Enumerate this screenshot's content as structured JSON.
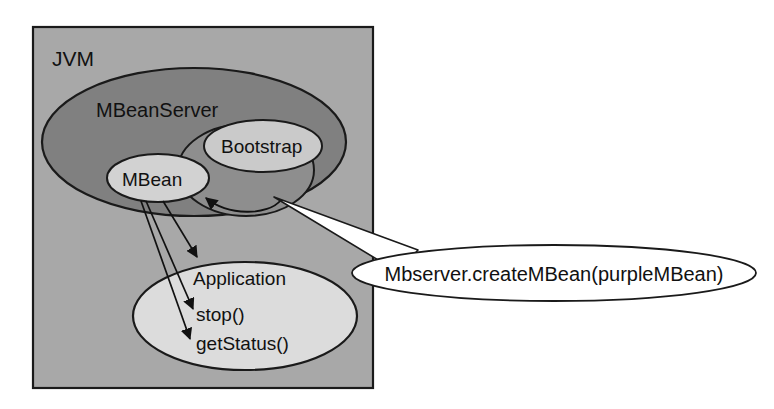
{
  "diagram": {
    "nodes": {
      "jvm": {
        "label": "JVM",
        "shape": "rectangle",
        "fill": "#a8a8a8"
      },
      "mbeanserver": {
        "label": "MBeanServer",
        "shape": "ellipse",
        "fill": "#808080"
      },
      "bootstrap": {
        "label": "Bootstrap",
        "shape": "ellipse",
        "fill": "#cacaca"
      },
      "agent": {
        "label": "",
        "shape": "ellipse",
        "fill": "#8e8e8e"
      },
      "mbean": {
        "label": "MBean",
        "shape": "ellipse",
        "fill": "#d2d2d2"
      },
      "application": {
        "label": "Application",
        "shape": "ellipse",
        "fill": "#dcdcdc",
        "methods": [
          "stop()",
          "getStatus()"
        ]
      },
      "callout": {
        "label": "Mbserver.createMBean(purpleMBean)",
        "shape": "callout-ellipse",
        "fill": "#ffffff"
      }
    },
    "colors": {
      "outline": "#1a1a1a",
      "text": "#111111",
      "page_background": "#ffffff",
      "jvm_fill": "#a8a8a8",
      "mbeanserver_fill": "#808080",
      "agent_fill": "#8e8e8e",
      "bootstrap_fill": "#cacaca",
      "mbean_fill": "#d2d2d2",
      "application_fill": "#dcdcdc",
      "callout_fill": "#ffffff"
    },
    "edges": [
      {
        "from": "mbean",
        "to": "application",
        "style": "arrow",
        "target_label": ""
      },
      {
        "from": "mbean",
        "to": "application",
        "style": "arrow",
        "target_label": "stop()"
      },
      {
        "from": "mbean",
        "to": "application",
        "style": "arrow",
        "target_label": "getStatus()"
      },
      {
        "from": "agent",
        "to": "mbean",
        "style": "curved-arrow",
        "target_label": ""
      },
      {
        "from": "callout",
        "to": "agent",
        "style": "white-pointer",
        "target_label": ""
      }
    ]
  }
}
